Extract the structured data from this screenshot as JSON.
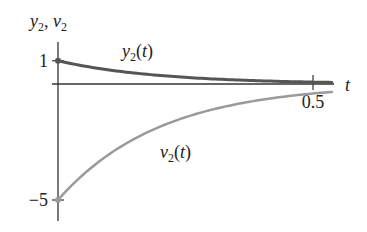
{
  "chart_data": {
    "type": "line",
    "title": "",
    "axis_title_y": "y2, v2",
    "xlabel": "t",
    "ylabel": "y2, v2",
    "xlim": [
      0,
      0.54
    ],
    "ylim": [
      -5.6,
      1.8
    ],
    "x_ticks": [
      {
        "value": 0.5,
        "label": "0.5"
      }
    ],
    "y_ticks": [
      {
        "value": 1,
        "label": "1"
      },
      {
        "value": -5,
        "label": "−5"
      }
    ],
    "grid": false,
    "series": [
      {
        "name": "y2(t)",
        "label_base": "y",
        "label_sub": "2",
        "label_arg": "(t)",
        "formula": "e^(-5t)",
        "color": "#555555",
        "stroke_width": 3,
        "x": [
          0,
          0.1,
          0.2,
          0.3,
          0.4,
          0.5,
          0.537
        ],
        "values": [
          1.0,
          0.61,
          0.37,
          0.22,
          0.14,
          0.08,
          0.07
        ]
      },
      {
        "name": "v2(t)",
        "label_base": "v",
        "label_sub": "2",
        "label_arg": "(t)",
        "formula": "-5 e^(-5t)",
        "color": "#9a9a9a",
        "stroke_width": 2.5,
        "x": [
          0,
          0.1,
          0.2,
          0.3,
          0.4,
          0.5,
          0.537
        ],
        "values": [
          -5.0,
          -3.03,
          -1.84,
          -1.12,
          -0.68,
          -0.41,
          -0.34
        ]
      }
    ],
    "axis_color": "#333333"
  }
}
